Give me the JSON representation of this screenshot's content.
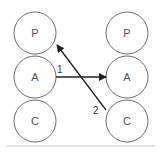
{
  "diagram": {
    "type": "node-link",
    "left_column": {
      "nodes": [
        {
          "label": "P",
          "cx": 35,
          "cy": 33
        },
        {
          "label": "A",
          "cx": 35,
          "cy": 77
        },
        {
          "label": "C",
          "cx": 35,
          "cy": 121
        }
      ]
    },
    "right_column": {
      "nodes": [
        {
          "label": "P",
          "cx": 127,
          "cy": 33
        },
        {
          "label": "A",
          "cx": 127,
          "cy": 77
        },
        {
          "label": "C",
          "cx": 127,
          "cy": 121
        }
      ]
    },
    "node_radius": 21,
    "edges": [
      {
        "label": "1",
        "from": "left.A",
        "to": "right.A"
      },
      {
        "label": "2",
        "from": "right.C",
        "to": "left.P"
      }
    ],
    "colors": {
      "node_stroke": "#6e6e6e",
      "arrow": "#222222",
      "rule": "#c8c8c8"
    }
  }
}
